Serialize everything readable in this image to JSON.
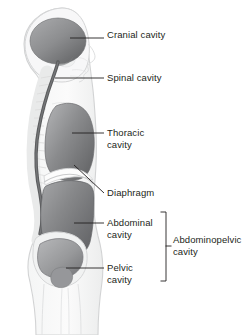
{
  "figure": {
    "view": "lateral sagittal section of human body",
    "background_color": "#ffffff",
    "palette": {
      "cavity_fill_dark": "#6e6f71",
      "cavity_fill_mid": "#8a8b8d",
      "cavity_fill_light": "#a7a8aa",
      "body_outline": "#d9dadb",
      "skeleton_light": "#eceded",
      "spinal_cord": "#58595b",
      "leader_line": "#231f20",
      "text": "#231f20"
    }
  },
  "labels": {
    "cranial": {
      "text": "Cranial cavity",
      "x": 107,
      "y": 29
    },
    "spinal": {
      "text": "Spinal cavity",
      "x": 107,
      "y": 72
    },
    "thoracic": {
      "text": "Thoracic\ncavity",
      "x": 107,
      "y": 123
    },
    "diaphragm": {
      "text": "Diaphragm",
      "x": 107,
      "y": 188
    },
    "abdominal": {
      "text": "Abdominal\ncavity",
      "x": 107,
      "y": 213
    },
    "pelvic": {
      "text": "Pelvic\ncavity",
      "x": 107,
      "y": 258
    },
    "abdominopelvic": {
      "text": "Abdominopelvic\ncavity",
      "x": 173,
      "y": 235
    }
  },
  "cavities": [
    {
      "name": "cranial-cavity",
      "label": "Cranial cavity"
    },
    {
      "name": "spinal-cavity",
      "label": "Spinal cavity"
    },
    {
      "name": "thoracic-cavity",
      "label": "Thoracic cavity"
    },
    {
      "name": "diaphragm",
      "label": "Diaphragm"
    },
    {
      "name": "abdominal-cavity",
      "label": "Abdominal cavity"
    },
    {
      "name": "pelvic-cavity",
      "label": "Pelvic cavity"
    },
    {
      "name": "abdominopelvic-cavity",
      "label": "Abdominopelvic cavity"
    }
  ],
  "bracket": {
    "name": "abdominopelvic-bracket",
    "x": 166,
    "top": 212,
    "bottom": 281,
    "tick_y": 246,
    "arm": 5
  }
}
